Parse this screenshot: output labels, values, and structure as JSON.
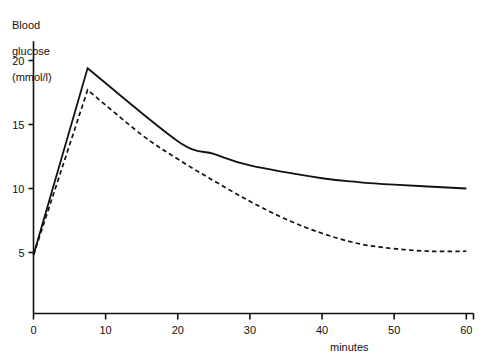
{
  "chart_data": {
    "type": "line",
    "title": "",
    "xlabel": "minutes",
    "ylabel": "Blood glucose (mmol/l)",
    "ylabel_lines": [
      "Blood",
      "glucose",
      "(mmol/l)"
    ],
    "xlim": [
      0,
      61
    ],
    "ylim": [
      0,
      21.5
    ],
    "xticks": [
      0,
      10,
      20,
      30,
      40,
      50,
      60
    ],
    "xticklabels": [
      "0",
      "10",
      "20",
      "30",
      "40",
      "50",
      "60"
    ],
    "yticks": [
      5,
      10,
      15,
      20
    ],
    "yticklabels": [
      "5",
      "10",
      "15",
      "20"
    ],
    "grid": false,
    "legend": "none",
    "series": [
      {
        "name": "solid-curve",
        "style": "solid",
        "color": "#111111",
        "points": [
          [
            0,
            4.8
          ],
          [
            7.5,
            19.4
          ],
          [
            20,
            13.7
          ],
          [
            25,
            12.7
          ],
          [
            30,
            11.8
          ],
          [
            40,
            10.8
          ],
          [
            45,
            10.5
          ],
          [
            50,
            10.3
          ],
          [
            60,
            10.0
          ]
        ]
      },
      {
        "name": "dashed-curve",
        "style": "dashed",
        "color": "#111111",
        "points": [
          [
            0,
            4.8
          ],
          [
            7.5,
            17.7
          ],
          [
            15,
            14.2
          ],
          [
            20,
            12.3
          ],
          [
            25,
            10.6
          ],
          [
            30,
            9.0
          ],
          [
            35,
            7.6
          ],
          [
            40,
            6.5
          ],
          [
            45,
            5.7
          ],
          [
            50,
            5.3
          ],
          [
            55,
            5.1
          ],
          [
            60,
            5.1
          ]
        ]
      }
    ]
  },
  "axes": {
    "y_title_line1": "Blood",
    "y_title_line2": "glucose",
    "y_title_line3": "(mmol/l)",
    "x_title": "minutes"
  },
  "ticks": {
    "y": [
      "20",
      "15",
      "10",
      "5"
    ],
    "x": [
      "0",
      "10",
      "20",
      "30",
      "40",
      "50",
      "60"
    ]
  }
}
